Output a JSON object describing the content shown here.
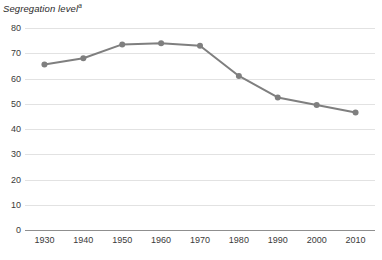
{
  "chart_data": {
    "type": "line",
    "title": "Segregation level",
    "title_superscript": "a",
    "xlabel": "",
    "ylabel": "",
    "categories": [
      "1930",
      "1940",
      "1950",
      "1960",
      "1970",
      "1980",
      "1990",
      "2000",
      "2010"
    ],
    "x": [
      1930,
      1940,
      1950,
      1960,
      1970,
      1980,
      1990,
      2000,
      2010
    ],
    "values": [
      65.5,
      68.0,
      73.5,
      74.0,
      73.0,
      61.0,
      52.5,
      49.5,
      46.5
    ],
    "series": [
      {
        "name": "Segregation level",
        "values": [
          65.5,
          68.0,
          73.5,
          74.0,
          73.0,
          61.0,
          52.5,
          49.5,
          46.5
        ]
      }
    ],
    "ylim": [
      0,
      80
    ],
    "yticks": [
      0,
      10,
      20,
      30,
      40,
      50,
      60,
      70,
      80
    ],
    "ytick_labels": [
      "0",
      "10",
      "20",
      "30",
      "40",
      "50",
      "60",
      "70",
      "80"
    ],
    "xlim": [
      1925,
      2015
    ],
    "grid": true,
    "legend": false,
    "legend_position": "none",
    "colors": {
      "line": "#7f7f7f",
      "marker": "#7f7f7f",
      "gridline": "#e2e2e2",
      "axis": "#8f8f8f",
      "text": "#3a3a3a",
      "background": "#ffffff"
    },
    "marker": "circle",
    "marker_size": 5,
    "line_width": 2
  }
}
